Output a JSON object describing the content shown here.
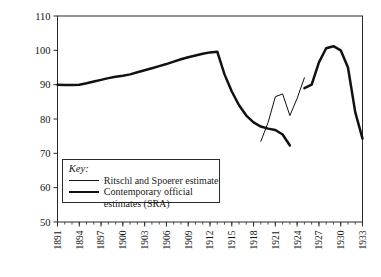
{
  "chart_data": {
    "type": "line",
    "title": "",
    "xlabel": "",
    "ylabel": "",
    "xlim": [
      1891,
      1933
    ],
    "ylim": [
      50,
      110
    ],
    "yticks": [
      50,
      60,
      70,
      80,
      90,
      100,
      110
    ],
    "xticks": [
      1891,
      1894,
      1897,
      1900,
      1903,
      1906,
      1909,
      1912,
      1915,
      1918,
      1921,
      1924,
      1927,
      1930,
      1933
    ],
    "xtick_labels": [
      "1891",
      "1894",
      "1897",
      "1900",
      "1903",
      "1906",
      "1909",
      "1912",
      "1915",
      "1918",
      "1921",
      "1924",
      "1927",
      "1930",
      "1933"
    ],
    "ytick_labels": [
      "50",
      "60",
      "70",
      "80",
      "90",
      "100",
      "110"
    ],
    "grid": false,
    "minor_xticks_every": 1,
    "legend_position": "lower-left-inside",
    "series": [
      {
        "name": "Contemporary official estimates (SRA)",
        "style": "thick",
        "color": "#111111",
        "x": [
          1891,
          1892,
          1893,
          1894,
          1895,
          1896,
          1897,
          1898,
          1899,
          1900,
          1901,
          1902,
          1903,
          1904,
          1905,
          1906,
          1907,
          1908,
          1909,
          1910,
          1911,
          1912,
          1913,
          1914,
          1915,
          1916,
          1917,
          1918,
          1919,
          1920,
          1921,
          1922,
          1923,
          1924,
          1925,
          1926,
          1927,
          1928,
          1929,
          1930,
          1931,
          1932,
          1933
        ],
        "values": [
          90.0,
          89.9,
          89.9,
          90.0,
          90.4,
          90.9,
          91.4,
          91.9,
          92.3,
          92.6,
          93.0,
          93.6,
          94.2,
          94.8,
          95.4,
          96.0,
          96.7,
          97.4,
          98.0,
          98.5,
          99.0,
          99.4,
          99.6,
          93.0,
          88.0,
          84.0,
          81.0,
          79.0,
          77.8,
          77.2,
          76.8,
          75.5,
          72.3,
          null,
          89.0,
          90.0,
          96.5,
          100.6,
          101.2,
          100.0,
          95.0,
          82.0,
          74.3
        ]
      },
      {
        "name": "Ritschl and Spoerer estimate",
        "style": "thin",
        "color": "#111111",
        "x": [
          1919,
          1920,
          1921,
          1922,
          1923,
          1924,
          1925
        ],
        "values": [
          73.5,
          79.0,
          86.5,
          87.3,
          81.0,
          86.0,
          92.0
        ]
      }
    ]
  },
  "legend": {
    "title": "Key:",
    "entries": [
      {
        "label": "Ritschl and Spoerer estimate",
        "style": "thin"
      },
      {
        "label": "Contemporary official estimates (SRA)",
        "style": "thick"
      }
    ]
  },
  "colors": {
    "line": "#111111",
    "axis": "#2a2a2a",
    "background": "#ffffff"
  }
}
